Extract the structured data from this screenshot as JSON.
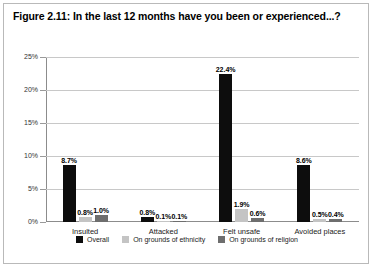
{
  "chart_data": {
    "type": "bar",
    "title": "Figure 2.11: In the last 12 months have you been or experienced...?",
    "xlabel": "",
    "ylabel": "",
    "ylim": [
      0,
      25
    ],
    "ytick_labels": [
      "0%",
      "5%",
      "10%",
      "15%",
      "20%",
      "25%"
    ],
    "ytick_values": [
      0,
      5,
      10,
      15,
      20,
      25
    ],
    "grid": true,
    "legend_position": "bottom",
    "categories": [
      "Insulted",
      "Attacked",
      "Felt unsafe",
      "Avoided places"
    ],
    "series": [
      {
        "name": "Overall",
        "color": "#0d0d0d",
        "values": [
          8.7,
          0.8,
          22.4,
          8.6
        ],
        "labels": [
          "8.7%",
          "0.8%",
          "22.4%",
          "8.6%"
        ]
      },
      {
        "name": "On grounds of ethnicity",
        "color": "#c4c4c4",
        "values": [
          0.8,
          0.1,
          1.9,
          0.5
        ],
        "labels": [
          "0.8%",
          "0.1%",
          "1.9%",
          "0.5%"
        ]
      },
      {
        "name": "On grounds of religion",
        "color": "#6e6e6e",
        "values": [
          1.0,
          0.1,
          0.6,
          0.4
        ],
        "labels": [
          "1.0%",
          "0.1%",
          "0.6%",
          "0.4%"
        ]
      }
    ]
  }
}
